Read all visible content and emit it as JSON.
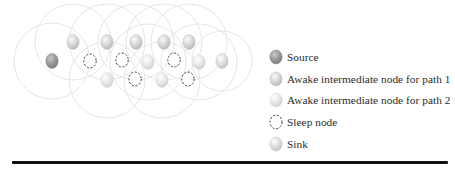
{
  "figure": {
    "type": "wireless-sensor-network-diagram",
    "colors": {
      "source": "#8f8f8f",
      "path1": "#cfcfcf",
      "path2": "#e4e4e4",
      "sink": "#d6d6d6",
      "sleep_stroke": "#444444",
      "range_circle": "#e6e6e6",
      "rule": "#111111"
    },
    "nodes": [
      {
        "id": "source",
        "type": "source",
        "x": 52,
        "y": 61
      },
      {
        "id": "t1",
        "type": "path1",
        "x": 73,
        "y": 42
      },
      {
        "id": "t2",
        "type": "path1",
        "x": 107,
        "y": 42
      },
      {
        "id": "t3",
        "type": "path1",
        "x": 136,
        "y": 42
      },
      {
        "id": "t4",
        "type": "path1",
        "x": 164,
        "y": 42
      },
      {
        "id": "t5",
        "type": "path1",
        "x": 189,
        "y": 42
      },
      {
        "id": "m1",
        "type": "sleep",
        "x": 90,
        "y": 61
      },
      {
        "id": "m2",
        "type": "sleep",
        "x": 122,
        "y": 60
      },
      {
        "id": "m3",
        "type": "path2",
        "x": 148,
        "y": 62
      },
      {
        "id": "m4",
        "type": "sleep",
        "x": 174,
        "y": 60
      },
      {
        "id": "m5",
        "type": "path2",
        "x": 199,
        "y": 62
      },
      {
        "id": "sink",
        "type": "sink",
        "x": 222,
        "y": 61
      },
      {
        "id": "b1",
        "type": "path2",
        "x": 107,
        "y": 80
      },
      {
        "id": "b2",
        "type": "sleep",
        "x": 135,
        "y": 79
      },
      {
        "id": "b3",
        "type": "path2",
        "x": 162,
        "y": 80
      },
      {
        "id": "b4",
        "type": "sleep",
        "x": 188,
        "y": 79
      }
    ],
    "range_circles": [
      {
        "cx": 52,
        "cy": 61,
        "r": 38
      },
      {
        "cx": 73,
        "cy": 42,
        "r": 38
      },
      {
        "cx": 107,
        "cy": 42,
        "r": 38
      },
      {
        "cx": 107,
        "cy": 80,
        "r": 38
      },
      {
        "cx": 136,
        "cy": 42,
        "r": 38
      },
      {
        "cx": 148,
        "cy": 62,
        "r": 38
      },
      {
        "cx": 162,
        "cy": 80,
        "r": 38
      },
      {
        "cx": 164,
        "cy": 42,
        "r": 38
      },
      {
        "cx": 189,
        "cy": 42,
        "r": 38
      },
      {
        "cx": 199,
        "cy": 62,
        "r": 38
      },
      {
        "cx": 222,
        "cy": 61,
        "r": 30
      }
    ]
  },
  "legend": {
    "items": [
      {
        "key": "source",
        "label": "Source"
      },
      {
        "key": "path1",
        "label": "Awake intermediate node for path 1"
      },
      {
        "key": "path2",
        "label": "Awake intermediate node for path 2"
      },
      {
        "key": "sleep",
        "label": "Sleep node"
      },
      {
        "key": "sink",
        "label": "Sink"
      }
    ]
  }
}
